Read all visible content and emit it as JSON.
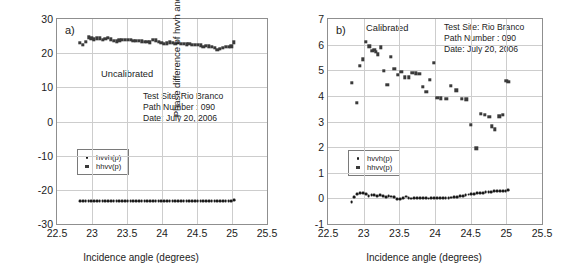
{
  "figure": {
    "panels": [
      {
        "letter": "a)",
        "state_label": "Uncalibrated",
        "xlabel": "Incidence angle (degrees)",
        "ylabel": "Phase difference of hvvh and hhvv (degrees)",
        "annotation": [
          "Test Site: Rio Branco",
          "Path Number : 090",
          "Date: July 20, 2006"
        ],
        "legend": [
          {
            "label": "hvvh(p)",
            "marker": "dot"
          },
          {
            "label": "hhvv(p)",
            "marker": "square"
          }
        ]
      },
      {
        "letter": "b)",
        "state_label": "Calibrated",
        "xlabel": "Incidence angle (degrees)",
        "ylabel": "Phase difference of hvvh and hhvv (degrees)",
        "annotation": [
          "Test Site: Rio Branco",
          "Path Number : 090",
          "Date: July 20, 2006"
        ],
        "legend": [
          {
            "label": "hvvh(p)",
            "marker": "dot"
          },
          {
            "label": "hhvv(p)",
            "marker": "square"
          }
        ]
      }
    ]
  },
  "chart_data": [
    {
      "type": "scatter",
      "panel": "a",
      "title": "Uncalibrated",
      "xlabel": "Incidence angle (degrees)",
      "ylabel": "Phase difference of hvvh and hhvv (degrees)",
      "xlim": [
        22.5,
        25.5
      ],
      "ylim": [
        -30,
        30
      ],
      "xticks": [
        22.5,
        23,
        23.5,
        24,
        24.5,
        25,
        25.5
      ],
      "yticks": [
        30,
        20,
        10,
        0,
        -10,
        -20,
        -30
      ],
      "grid": true,
      "legend_position": "center-left",
      "annotations": [
        "a)",
        "Uncalibrated",
        "Test Site: Rio Branco",
        "Path Number : 090",
        "Date: July 20, 2006"
      ],
      "series": [
        {
          "name": "hhvv(p)",
          "marker": "square",
          "x": [
            22.83,
            22.87,
            22.91,
            22.95,
            22.99,
            23.03,
            23.07,
            23.11,
            23.15,
            23.19,
            23.23,
            23.27,
            23.31,
            23.35,
            23.39,
            23.43,
            23.47,
            23.51,
            23.55,
            23.59,
            23.63,
            23.67,
            23.71,
            23.75,
            23.79,
            23.83,
            23.87,
            23.91,
            23.95,
            23.99,
            24.03,
            24.07,
            24.11,
            24.15,
            24.19,
            24.23,
            24.27,
            24.31,
            24.35,
            24.39,
            24.43,
            24.47,
            24.51,
            24.55,
            24.59,
            24.63,
            24.67,
            24.71,
            24.75,
            24.79,
            24.83,
            24.87,
            24.91,
            24.95,
            24.99,
            25.03
          ],
          "y": [
            23.1,
            22.4,
            23.3,
            24.6,
            24.4,
            24.1,
            24.4,
            24.3,
            24.0,
            24.2,
            24.5,
            24.1,
            23.6,
            23.5,
            23.8,
            24.0,
            23.9,
            23.9,
            23.9,
            23.7,
            23.7,
            23.6,
            23.5,
            23.4,
            23.3,
            23.2,
            23.9,
            23.8,
            23.4,
            23.0,
            22.8,
            22.9,
            23.2,
            23.0,
            22.8,
            23.0,
            22.7,
            22.8,
            22.6,
            22.7,
            22.5,
            22.4,
            22.5,
            22.3,
            21.8,
            22.2,
            22.0,
            21.9,
            21.5,
            20.9,
            21.3,
            21.6,
            21.9,
            21.9,
            22.0,
            23.2
          ]
        },
        {
          "name": "hvvh(p)",
          "marker": "dot",
          "x": [
            22.83,
            22.87,
            22.91,
            22.95,
            22.99,
            23.03,
            23.07,
            23.11,
            23.15,
            23.19,
            23.23,
            23.27,
            23.31,
            23.35,
            23.39,
            23.43,
            23.47,
            23.51,
            23.55,
            23.59,
            23.63,
            23.67,
            23.71,
            23.75,
            23.79,
            23.83,
            23.87,
            23.91,
            23.95,
            23.99,
            24.03,
            24.07,
            24.11,
            24.15,
            24.19,
            24.23,
            24.27,
            24.31,
            24.35,
            24.39,
            24.43,
            24.47,
            24.51,
            24.55,
            24.59,
            24.63,
            24.67,
            24.71,
            24.75,
            24.79,
            24.83,
            24.87,
            24.91,
            24.95,
            24.99,
            25.03
          ],
          "y": [
            -23.4,
            -23.3,
            -23.3,
            -23.3,
            -23.3,
            -23.3,
            -23.2,
            -23.2,
            -23.2,
            -23.2,
            -23.2,
            -23.2,
            -23.2,
            -23.2,
            -23.2,
            -23.2,
            -23.2,
            -23.2,
            -23.2,
            -23.2,
            -23.2,
            -23.2,
            -23.2,
            -23.2,
            -23.2,
            -23.2,
            -23.2,
            -23.2,
            -23.2,
            -23.2,
            -23.2,
            -23.2,
            -23.2,
            -23.2,
            -23.2,
            -23.2,
            -23.2,
            -23.2,
            -23.2,
            -23.2,
            -23.2,
            -23.2,
            -23.2,
            -23.2,
            -23.2,
            -23.2,
            -23.2,
            -23.2,
            -23.2,
            -23.2,
            -23.2,
            -23.2,
            -23.2,
            -23.2,
            -23.2,
            -23.1
          ]
        }
      ]
    },
    {
      "type": "scatter",
      "panel": "b",
      "title": "Calibrated",
      "xlabel": "Incidence angle (degrees)",
      "ylabel": "Phase difference of hvvh and hhvv (degrees)",
      "xlim": [
        22.5,
        25.5
      ],
      "ylim": [
        -1,
        7
      ],
      "xticks": [
        22.5,
        23,
        23.5,
        24,
        24.5,
        25,
        25.5
      ],
      "yticks": [
        7,
        6,
        5,
        4,
        3,
        2,
        1,
        0,
        -1
      ],
      "grid": true,
      "legend_position": "center-left",
      "annotations": [
        "b)",
        "Calibrated",
        "Test Site: Rio Branco",
        "Path Number : 090",
        "Date: July 20, 2006"
      ],
      "series": [
        {
          "name": "hhvv(p)",
          "marker": "square",
          "x": [
            22.83,
            22.9,
            22.95,
            22.99,
            23.03,
            23.08,
            23.12,
            23.15,
            23.17,
            23.2,
            23.24,
            23.28,
            23.33,
            23.38,
            23.43,
            23.48,
            23.53,
            23.58,
            23.63,
            23.68,
            23.73,
            23.78,
            23.83,
            23.88,
            23.93,
            23.98,
            24.03,
            24.08,
            24.16,
            24.22,
            24.3,
            24.38,
            24.44,
            24.5,
            24.58,
            24.64,
            24.7,
            24.76,
            24.8,
            24.84,
            24.9,
            24.95,
            25.0,
            25.03
          ],
          "y": [
            4.5,
            3.72,
            5.17,
            5.42,
            6.1,
            5.93,
            5.75,
            5.8,
            5.72,
            5.62,
            5.9,
            4.98,
            4.43,
            5.52,
            5.05,
            4.82,
            4.95,
            4.73,
            4.72,
            4.9,
            4.88,
            4.87,
            4.35,
            4.17,
            4.63,
            5.3,
            3.93,
            3.9,
            3.88,
            4.4,
            4.21,
            3.88,
            3.86,
            2.88,
            1.95,
            3.3,
            3.25,
            3.18,
            2.82,
            2.7,
            3.2,
            3.25,
            4.58,
            4.55
          ]
        },
        {
          "name": "hvvh(p)",
          "marker": "dot",
          "x": [
            22.83,
            22.87,
            22.91,
            22.95,
            22.99,
            23.03,
            23.07,
            23.11,
            23.15,
            23.19,
            23.23,
            23.27,
            23.31,
            23.35,
            23.39,
            23.43,
            23.47,
            23.51,
            23.55,
            23.59,
            23.63,
            23.67,
            23.71,
            23.75,
            23.79,
            23.83,
            23.87,
            23.91,
            23.95,
            23.99,
            24.03,
            24.07,
            24.11,
            24.15,
            24.19,
            24.23,
            24.27,
            24.31,
            24.35,
            24.39,
            24.43,
            24.47,
            24.51,
            24.55,
            24.59,
            24.63,
            24.67,
            24.71,
            24.75,
            24.79,
            24.83,
            24.87,
            24.91,
            24.95,
            24.99,
            25.03
          ],
          "y": [
            -0.13,
            0.06,
            0.17,
            0.22,
            0.2,
            0.16,
            0.1,
            0.12,
            0.12,
            0.08,
            0.13,
            0.08,
            0.05,
            0.1,
            0.07,
            0.04,
            -0.02,
            -0.03,
            0.0,
            0.07,
            0.0,
            -0.01,
            0.0,
            0.01,
            0.0,
            0.0,
            0.0,
            -0.01,
            0.0,
            0.0,
            0.0,
            0.01,
            0.02,
            0.02,
            0.02,
            0.03,
            0.04,
            0.06,
            0.08,
            0.09,
            0.12,
            0.15,
            0.16,
            0.18,
            0.2,
            0.22,
            0.22,
            0.24,
            0.26,
            0.26,
            0.27,
            0.28,
            0.28,
            0.27,
            0.27,
            0.32
          ]
        }
      ]
    }
  ]
}
